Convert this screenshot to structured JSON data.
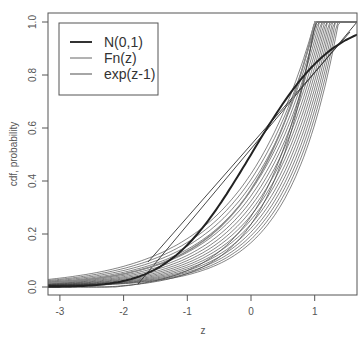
{
  "chart_data": {
    "type": "line",
    "title": "",
    "xlabel": "z",
    "ylabel": "cdf, probability",
    "xlim": [
      -3.2,
      1.66
    ],
    "ylim": [
      -0.03,
      1.03
    ],
    "x_ticks": [
      -3,
      -2,
      -1,
      0,
      1
    ],
    "x_tick_labels": [
      "-3",
      "-2",
      "-1",
      "0",
      "1"
    ],
    "y_ticks": [
      0.0,
      0.2,
      0.4,
      0.6,
      0.8,
      1.0
    ],
    "y_tick_labels": [
      "0.0",
      "0.2",
      "0.4",
      "0.6",
      "0.8",
      "1.0"
    ],
    "grid": false,
    "legend_position": "top-left",
    "legend": [
      "N(0,1)",
      "Fn(z)",
      "exp(z-1)"
    ],
    "series": [
      {
        "name": "N(0,1)",
        "x": [
          -3.2,
          -3,
          -2.5,
          -2,
          -1.5,
          -1,
          -0.5,
          0,
          0.5,
          1,
          1.5,
          1.66
        ],
        "values": [
          0.001,
          0.001,
          0.006,
          0.023,
          0.067,
          0.159,
          0.309,
          0.5,
          0.691,
          0.841,
          0.933,
          0.952
        ]
      },
      {
        "name": "Fn(z)",
        "note": "multiple empirical/transformed cdf curves converging to 1.0 near z=1"
      },
      {
        "name": "exp(z-1)",
        "x": [
          -3.2,
          -3,
          -2.5,
          -2,
          -1.5,
          -1,
          -0.5,
          0,
          0.5,
          1
        ],
        "values": [
          0.015,
          0.018,
          0.03,
          0.05,
          0.082,
          0.135,
          0.223,
          0.368,
          0.607,
          1.0
        ]
      }
    ]
  },
  "axes": {
    "xlabel": "z",
    "ylabel": "cdf, probability"
  },
  "legend": {
    "items": [
      {
        "label": "N(0,1)",
        "color": "#333333",
        "width": 2
      },
      {
        "label": "Fn(z)",
        "color": "#666666",
        "width": 1
      },
      {
        "label": "exp(z-1)",
        "color": "#888888",
        "width": 1.5
      }
    ]
  },
  "ticks": {
    "x": [
      {
        "v": -3,
        "label": "-3"
      },
      {
        "v": -2,
        "label": "-2"
      },
      {
        "v": -1,
        "label": "-1"
      },
      {
        "v": 0,
        "label": "0"
      },
      {
        "v": 1,
        "label": "1"
      }
    ],
    "y": [
      {
        "v": 0.0,
        "label": "0.0"
      },
      {
        "v": 0.2,
        "label": "0.2"
      },
      {
        "v": 0.4,
        "label": "0.4"
      },
      {
        "v": 0.6,
        "label": "0.6"
      },
      {
        "v": 0.8,
        "label": "0.8"
      },
      {
        "v": 1.0,
        "label": "1.0"
      }
    ]
  }
}
